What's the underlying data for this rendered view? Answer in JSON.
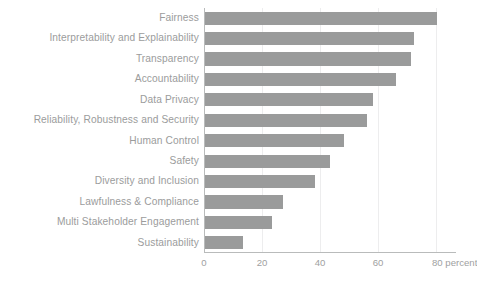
{
  "chart_data": {
    "type": "bar",
    "orientation": "horizontal",
    "title": "",
    "subtitle": "",
    "xlabel": "percent",
    "ylabel": "",
    "categories": [
      "Fairness",
      "Interpretability and Explainability",
      "Transparency",
      "Accountability",
      "Data Privacy",
      "Reliability, Robustness and Security",
      "Human Control",
      "Safety",
      "Diversity and Inclusion",
      "Lawfulness & Compliance",
      "Multi Stakeholder Engagement",
      "Sustainability"
    ],
    "values": [
      80,
      72,
      71,
      66,
      58,
      56,
      48,
      43,
      38,
      27,
      23,
      13
    ],
    "xlim": [
      0,
      86
    ],
    "xticks": [
      0,
      20,
      40,
      60,
      80
    ],
    "xticklabels": [
      "0",
      "20",
      "40",
      "60",
      "80"
    ],
    "unit_suffix": "percent",
    "grid": "vertical",
    "legend": "none",
    "bar_color": "#9a9b9b",
    "axis_color": "#b9bbbb",
    "grid_color": "#ededee",
    "label_color": "#9b9c9c",
    "tick_color": "#a0a1a1",
    "background": "#ffffff"
  }
}
